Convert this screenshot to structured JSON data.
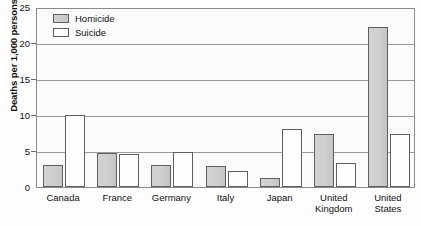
{
  "chart_data": {
    "type": "bar",
    "title": "",
    "xlabel": "",
    "ylabel": "Deaths per 1,000 persons",
    "ylim": [
      0,
      25
    ],
    "yticks": [
      0,
      5,
      10,
      15,
      20,
      25
    ],
    "grid": true,
    "legend_position": "top-left",
    "categories": [
      "Canada",
      "France",
      "Germany",
      "Italy",
      "Japan",
      "United\nKingdom",
      "United\nStates"
    ],
    "series": [
      {
        "name": "Homicide",
        "color": "#cccccc",
        "values": [
          3.1,
          4.7,
          3.1,
          2.9,
          1.2,
          7.3,
          22.2
        ]
      },
      {
        "name": "Suicide",
        "color": "#ffffff",
        "values": [
          10.0,
          4.6,
          4.9,
          2.2,
          8.0,
          3.3,
          7.4
        ]
      }
    ]
  },
  "legend": {
    "items": [
      {
        "label": "Homicide",
        "swatch": "filled-gray-swatch-icon"
      },
      {
        "label": "Suicide",
        "swatch": "outline-white-swatch-icon"
      }
    ]
  },
  "axis": {
    "y_title": "Deaths per 1,000 persons",
    "y_tick_labels": [
      "0",
      "5",
      "10",
      "15",
      "20",
      "25"
    ],
    "x_tick_labels": [
      "Canada",
      "France",
      "Germany",
      "Italy",
      "Japan",
      "United Kingdom",
      "United States"
    ]
  }
}
